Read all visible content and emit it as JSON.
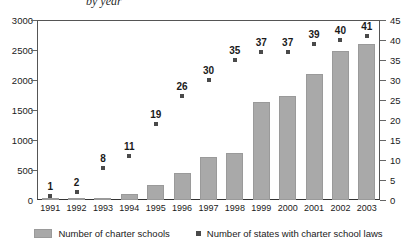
{
  "title": "by year",
  "legend": {
    "bar_icon": "bar-swatch-icon",
    "bar_label": "Number of charter schools",
    "marker_icon": "square-marker-icon",
    "marker_label": "Number of states with charter school laws"
  },
  "colors": {
    "bar": "#a9a9a9",
    "marker": "#4a4a4a",
    "axis": "#333333",
    "text": "#1a1a1a"
  },
  "chart_data": {
    "type": "bar",
    "title": "by year",
    "xlabel": "",
    "ylabel": "",
    "grid": false,
    "legend_position": "bottom",
    "categories": [
      "1991",
      "1992",
      "1993",
      "1994",
      "1995",
      "1996",
      "1997",
      "1998",
      "1999",
      "2000",
      "2001",
      "2002",
      "2003"
    ],
    "axes": {
      "left": {
        "label": "",
        "ylim": [
          0,
          3000
        ],
        "ticks": [
          0,
          500,
          1000,
          1500,
          2000,
          2500,
          3000
        ],
        "tick_labels": [
          "0",
          "500",
          "1000",
          "1500",
          "2000",
          "2500",
          "3000"
        ]
      },
      "right": {
        "label": "",
        "ylim": [
          0,
          45
        ],
        "ticks": [
          0,
          5,
          10,
          15,
          20,
          25,
          30,
          35,
          40,
          45
        ],
        "tick_labels": [
          "0",
          "5",
          "10",
          "15",
          "20",
          "25",
          "30",
          "35",
          "40",
          "45"
        ]
      }
    },
    "series": [
      {
        "name": "Number of charter schools",
        "type": "bar",
        "axis": "left",
        "color": "#a9a9a9",
        "values": [
          2,
          8,
          35,
          100,
          250,
          450,
          720,
          780,
          1630,
          1730,
          2100,
          2480,
          2600
        ]
      },
      {
        "name": "Number of states with charter school laws",
        "type": "scatter",
        "axis": "right",
        "color": "#4a4a4a",
        "values": [
          1,
          2,
          8,
          11,
          19,
          26,
          30,
          35,
          37,
          37,
          39,
          40,
          41
        ],
        "data_labels": [
          "1",
          "2",
          "8",
          "11",
          "19",
          "26",
          "30",
          "35",
          "37",
          "37",
          "39",
          "40",
          "41"
        ]
      }
    ]
  }
}
